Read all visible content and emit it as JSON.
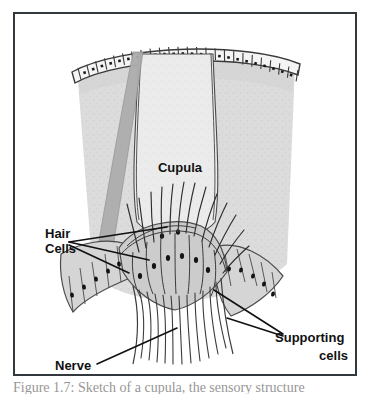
{
  "figure": {
    "caption": "Figure 1.7:  Sketch of a cupula, the sensory structure",
    "border_color": "#33383d",
    "background_color": "#ffffff"
  },
  "palette": {
    "tissue_gray": "#d9d9d9",
    "tissue_gray_dark": "#bdbdbd",
    "cupula_fill": "#e9e9e9",
    "band_gray": "#a8a8a8",
    "cell_fill": "#cfcfcf",
    "outline": "#3a3a3a",
    "nucleus": "#1c1c1c",
    "label_color": "#111111",
    "epithelium_fill": "#f2f2f2"
  },
  "labels": [
    {
      "id": "cupula",
      "text": "Cupula",
      "x": 165,
      "y": 158,
      "font_size": 13,
      "anchor": "middle",
      "lines": [
        "Cupula"
      ]
    },
    {
      "id": "hair-cells",
      "text": "Hair Cells",
      "x": 30,
      "y": 224,
      "font_size": 13,
      "anchor": "start",
      "lines": [
        "Hair",
        "Cells"
      ]
    },
    {
      "id": "nerve",
      "text": "Nerve",
      "x": 40,
      "y": 356,
      "font_size": 13,
      "anchor": "start",
      "lines": [
        "Nerve"
      ]
    },
    {
      "id": "supporting-cells",
      "text": "Supporting cells",
      "x": 340,
      "y": 333,
      "font_size": 13,
      "anchor": "end",
      "lines": [
        "Supporting",
        "cells"
      ]
    }
  ],
  "structures": [
    {
      "id": "epithelium",
      "name": "epithelial cell row",
      "cell_count": 27
    },
    {
      "id": "cupula",
      "name": "cupula gelatinous mass"
    },
    {
      "id": "hair-cells",
      "name": "hair cells with stereocilia",
      "count": 8
    },
    {
      "id": "supporting-cells-left",
      "name": "supporting cells left flank",
      "count": 6
    },
    {
      "id": "supporting-cells-right",
      "name": "supporting cells right flank",
      "count": 6
    },
    {
      "id": "nerve-bundle",
      "name": "nerve fiber bundle",
      "fiber_count": 11
    },
    {
      "id": "reticular-tissue",
      "name": "reticular honeycomb tissue"
    }
  ],
  "leader_lines": [
    {
      "from": "hair-cells",
      "to_x": 150,
      "to_y": 212
    },
    {
      "from": "hair-cells",
      "to_x": 132,
      "to_y": 244
    },
    {
      "from": "hair-cells",
      "to_x": 113,
      "to_y": 258
    },
    {
      "from": "nerve",
      "to_x": 160,
      "to_y": 315
    },
    {
      "from": "supporting-cells",
      "to_x": 200,
      "to_y": 277
    },
    {
      "from": "supporting-cells",
      "to_x": 212,
      "to_y": 305
    }
  ]
}
